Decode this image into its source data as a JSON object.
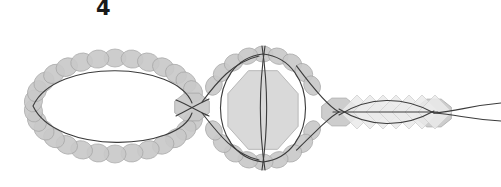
{
  "figure": {
    "label": "4",
    "label_x": 96,
    "label_y": -4,
    "background_color": "#ffffff",
    "curve_color": "#3c3c3c",
    "blob_fill": "#c9c9c9",
    "blob_stroke": "#a8a8a8",
    "polygon_fill": "#d8d8d8",
    "polygon_stroke": "#b4b4b4",
    "diamond_fill": "#ebebeb",
    "diamond_stroke": "#d2d2d2",
    "curve_width": 1.1
  },
  "chart_data": {
    "type": "diagram",
    "title": "4",
    "xlabel": "",
    "ylabel": "",
    "xlim": [
      0,
      501
    ],
    "ylim": [
      0,
      187
    ],
    "grid": false,
    "legend": "none",
    "components": [
      {
        "name": "left-loop",
        "shape": "ellipse",
        "cx": 115,
        "cy": 106,
        "rx": 82,
        "ry": 48,
        "blob_count": 30,
        "blob_rx": 9,
        "blob_ry": 11
      },
      {
        "name": "middle-loop",
        "shape": "circle",
        "cx": 263,
        "cy": 108,
        "rx": 54,
        "ry": 54,
        "blob_count": 22,
        "blob_rx": 8,
        "blob_ry": 10
      },
      {
        "name": "center-octagon",
        "shape": "octagon",
        "cx": 263,
        "cy": 110,
        "radius": 38
      },
      {
        "name": "left-junction-blob",
        "shape": "octagon",
        "cx": 192,
        "cy": 107,
        "radius": 15
      },
      {
        "name": "right-junction-blob",
        "shape": "octagon",
        "cx": 339,
        "cy": 112,
        "radius": 15
      },
      {
        "name": "terminal-blob",
        "shape": "octagon",
        "cx": 434,
        "cy": 113,
        "radius": 15
      },
      {
        "name": "right-lens",
        "shape": "lens",
        "x_start": 339,
        "x_end": 434,
        "cy": 112,
        "half_height": 16
      },
      {
        "name": "diamond-chain",
        "shape": "diamonds",
        "count": 7,
        "cx_start": 357,
        "cx_step": 13,
        "cy": 112,
        "half_diagonal": 17
      },
      {
        "name": "tail-lines",
        "shape": "split-tails",
        "x_start": 434,
        "x_end": 501,
        "cy": 113,
        "spread": 7
      }
    ]
  }
}
